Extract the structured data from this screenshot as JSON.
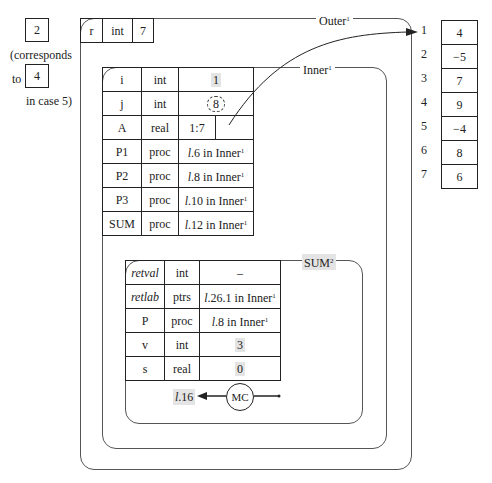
{
  "caller_note": {
    "value": "2",
    "line1": "(corresponds",
    "to": "to",
    "to_value": "4",
    "line3": "in case 5)"
  },
  "outer": {
    "label": "Outer",
    "label_sup": "1",
    "row": {
      "name": "r",
      "type": "int",
      "value": "7"
    }
  },
  "inner": {
    "label": "Inner",
    "label_sup": "1",
    "rows": [
      {
        "name": "i",
        "type": "int",
        "value": "1",
        "highlight": true
      },
      {
        "name": "j",
        "type": "int",
        "value": "8",
        "cloud": true
      },
      {
        "name": "A",
        "type": "real",
        "value": "1:7",
        "pointer": true
      },
      {
        "name": "P1",
        "type": "proc",
        "value": "l.6 in Inner",
        "line": "l",
        "num": ".6 in Inner",
        "sup": "1"
      },
      {
        "name": "P2",
        "type": "proc",
        "value": "l.8 in Inner",
        "line": "l",
        "num": ".8 in Inner",
        "sup": "1"
      },
      {
        "name": "P3",
        "type": "proc",
        "value": "l.10 in Inner",
        "line": "l",
        "num": ".10 in Inner",
        "sup": "1"
      },
      {
        "name": "SUM",
        "type": "proc",
        "value": "l.12 in Inner",
        "line": "l",
        "num": ".12 in Inner",
        "sup": "1"
      }
    ]
  },
  "sum": {
    "label": "SUM",
    "label_sup": "2",
    "rows": [
      {
        "name": "retval",
        "type": "int",
        "value": "–"
      },
      {
        "name": "retlab",
        "type": "ptrs",
        "line": "l",
        "num": ".26.1 in Inner",
        "sup": "1"
      },
      {
        "name": "P",
        "type": "proc",
        "line": "l",
        "num": ".8 in Inner",
        "sup": "1"
      },
      {
        "name": "v",
        "type": "int",
        "value": "3"
      },
      {
        "name": "s",
        "type": "real",
        "value": "0"
      }
    ],
    "mc_label": "MC",
    "return_line": "l",
    "return_num": ".16"
  },
  "array": {
    "indices": [
      "1",
      "2",
      "3",
      "4",
      "5",
      "6",
      "7"
    ],
    "values": [
      "4",
      "−5",
      "7",
      "9",
      "−4",
      "8",
      "6"
    ]
  }
}
